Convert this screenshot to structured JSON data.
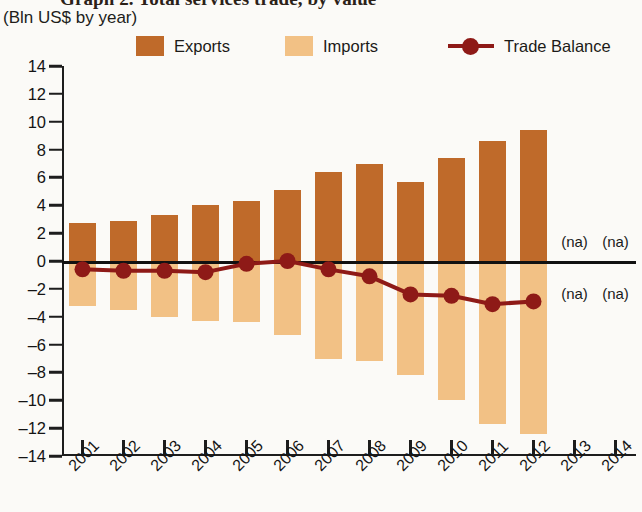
{
  "title": {
    "main": "Graph 2. Total services trade, by value",
    "subtitle": "(Bln US$ by year)"
  },
  "legend": {
    "position": "top",
    "entries": [
      {
        "label": "Exports",
        "color": "#bf6a2a",
        "marker": "square"
      },
      {
        "label": "Imports",
        "color": "#f2c185",
        "marker": "square"
      },
      {
        "label": "Trade Balance",
        "color": "#8e1a17",
        "marker": "line-circle"
      }
    ]
  },
  "axes": {
    "ylabel": "",
    "xlabel": "",
    "yticks": [
      14,
      12,
      10,
      8,
      6,
      4,
      2,
      0,
      -2,
      -4,
      -6,
      -8,
      -10,
      -12,
      -14
    ],
    "ytick_labels": [
      "14",
      "12",
      "10",
      "8",
      "6",
      "4",
      "2",
      "0",
      "–2",
      "–4",
      "–6",
      "–8",
      "–10",
      "–12",
      "–14"
    ],
    "ylim": [
      -14,
      14
    ],
    "xtick_labels": [
      "2001",
      "2002",
      "2003",
      "2004",
      "2005",
      "2006",
      "2007",
      "2008",
      "2009",
      "2010",
      "2011",
      "2012",
      "2013",
      "2014"
    ]
  },
  "annotations": {
    "na_text": "(na)",
    "na_years": [
      "2013",
      "2014"
    ],
    "na_placements": [
      "above-zero",
      "below-zero"
    ]
  },
  "chart_data": {
    "type": "bar",
    "title": "Graph 2. Total services trade, by value",
    "subtitle": "(Bln US$ by year)",
    "xlabel": "",
    "ylabel": "Bln US$",
    "ylim": [
      -14,
      14
    ],
    "ytick_step": 2,
    "grid": false,
    "legend_position": "top",
    "categories": [
      "2001",
      "2002",
      "2003",
      "2004",
      "2005",
      "2006",
      "2007",
      "2008",
      "2009",
      "2010",
      "2011",
      "2012",
      "2013",
      "2014"
    ],
    "series": [
      {
        "name": "Exports",
        "type": "bar",
        "color": "#bf6a2a",
        "values": [
          2.7,
          2.9,
          3.3,
          4.0,
          4.3,
          5.1,
          6.4,
          7.0,
          5.7,
          7.4,
          8.6,
          9.4,
          null,
          null
        ]
      },
      {
        "name": "Imports",
        "type": "bar",
        "color": "#f2c185",
        "values": [
          -3.2,
          -3.5,
          -4.0,
          -4.3,
          -4.4,
          -5.3,
          -7.0,
          -7.2,
          -8.2,
          -10.0,
          -11.7,
          -12.4,
          null,
          null
        ]
      },
      {
        "name": "Trade Balance",
        "type": "line",
        "color": "#8e1a17",
        "values": [
          -0.6,
          -0.7,
          -0.7,
          -0.8,
          -0.2,
          0.0,
          -0.6,
          -1.1,
          -2.4,
          -2.5,
          -3.1,
          -2.9,
          null,
          null
        ]
      }
    ]
  }
}
